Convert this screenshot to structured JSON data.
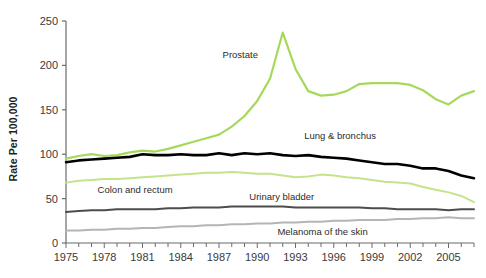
{
  "chart_data": {
    "type": "line",
    "title": "",
    "subtitle": "",
    "xlabel": "",
    "ylabel": "Rate Per 100,000",
    "xlim": [
      1975,
      2007
    ],
    "ylim": [
      0,
      250
    ],
    "yticks": [
      0,
      50,
      100,
      150,
      200,
      250
    ],
    "xticks": [
      1975,
      1978,
      1981,
      1984,
      1987,
      1990,
      1993,
      1996,
      1999,
      2002,
      2005
    ],
    "xtick_minor_step": 1,
    "grid": false,
    "legend": "inline-annotations",
    "x": [
      1975,
      1976,
      1977,
      1978,
      1979,
      1980,
      1981,
      1982,
      1983,
      1984,
      1985,
      1986,
      1987,
      1988,
      1989,
      1990,
      1991,
      1992,
      1993,
      1994,
      1995,
      1996,
      1997,
      1998,
      1999,
      2000,
      2001,
      2002,
      2003,
      2004,
      2005,
      2006,
      2007
    ],
    "series": [
      {
        "name": "Prostate",
        "color": "#a6d95b",
        "label": "Prostate",
        "label_x": 1987.2,
        "label_y": 212,
        "values": [
          95,
          98,
          100,
          98,
          99,
          102,
          104,
          103,
          106,
          110,
          114,
          118,
          122,
          131,
          143,
          160,
          185,
          237,
          196,
          171,
          166,
          167,
          171,
          179,
          180,
          180,
          180,
          178,
          172,
          162,
          156,
          166,
          171
        ]
      },
      {
        "name": "Lung & bronchus",
        "color": "#000000",
        "label": "Lung & bronchus",
        "label_x": 1993.6,
        "label_y": 121,
        "values": [
          91,
          93,
          94,
          95,
          96,
          97,
          100,
          99,
          99,
          100,
          99,
          99,
          101,
          99,
          101,
          100,
          101,
          99,
          98,
          99,
          97,
          96,
          95,
          93,
          91,
          89,
          89,
          87,
          84,
          84,
          81,
          76,
          73
        ]
      },
      {
        "name": "Colon and rectum",
        "color": "#c3e48a",
        "label": "Colon and rectum",
        "label_x": 1977.4,
        "label_y": 60,
        "values": [
          68,
          70,
          71,
          72,
          72,
          73,
          74,
          75,
          76,
          77,
          78,
          79,
          79,
          80,
          79,
          78,
          78,
          76,
          74,
          75,
          77,
          76,
          74,
          73,
          71,
          69,
          68,
          67,
          63,
          60,
          57,
          53,
          46
        ]
      },
      {
        "name": "Urinary bladder",
        "color": "#4d4d4d",
        "label": "Urinary bladder",
        "label_x": 1989.3,
        "label_y": 52,
        "values": [
          35,
          36,
          37,
          37,
          38,
          38,
          38,
          38,
          39,
          39,
          40,
          40,
          40,
          41,
          41,
          41,
          41,
          41,
          40,
          40,
          40,
          40,
          40,
          40,
          39,
          39,
          38,
          38,
          38,
          38,
          37,
          38,
          38
        ]
      },
      {
        "name": "Melanoma of the skin",
        "color": "#b5b5b5",
        "label": "Melanoma of the skin",
        "label_x": 1991.5,
        "label_y": 12,
        "values": [
          14,
          14,
          15,
          15,
          16,
          16,
          17,
          17,
          18,
          19,
          19,
          20,
          20,
          21,
          21,
          22,
          22,
          23,
          23,
          24,
          24,
          25,
          25,
          26,
          26,
          26,
          27,
          27,
          28,
          28,
          29,
          28,
          28
        ]
      }
    ]
  },
  "axes": {
    "ytick_labels": [
      "250",
      "200",
      "150",
      "100",
      "50",
      "0"
    ],
    "xtick_labels": [
      "1975",
      "1978",
      "1981",
      "1984",
      "1987",
      "1990",
      "1993",
      "1996",
      "1999",
      "2002",
      "2005"
    ]
  }
}
